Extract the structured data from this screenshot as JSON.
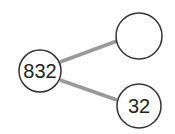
{
  "diagram": {
    "type": "number-bond",
    "whole": {
      "value": "832"
    },
    "parts": [
      {
        "value": ""
      },
      {
        "value": "32"
      }
    ],
    "colors": {
      "circle_stroke": "#333333",
      "connector": "#999999",
      "background": "#ffffff"
    }
  }
}
